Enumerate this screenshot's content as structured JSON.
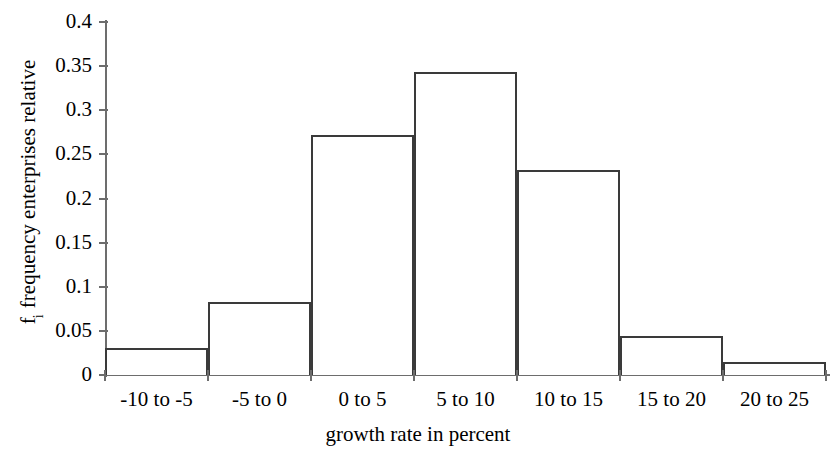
{
  "chart_data": {
    "type": "bar",
    "title": "",
    "subtitle": "",
    "xlabel": "growth rate in percent",
    "ylabel": "f_i frequency enterprises relative",
    "ylabel_main": "frequency enterprises relative",
    "ylabel_symbol": "f",
    "ylabel_subscript": "i",
    "categories": [
      "-10 to -5",
      "-5 to 0",
      "0 to 5",
      "5 to 10",
      "10 to 15",
      "15 to 20",
      "20 to 25"
    ],
    "values": [
      0.031,
      0.083,
      0.272,
      0.343,
      0.232,
      0.044,
      0.015
    ],
    "ylim": [
      0,
      0.4
    ],
    "xlim_bins": 7,
    "ytick_labels": [
      "0.4",
      "0.35",
      "0.3",
      "0.25",
      "0.2",
      "0.15",
      "0.1",
      "0.05",
      "0"
    ],
    "ytick_values": [
      0.4,
      0.35,
      0.3,
      0.25,
      0.2,
      0.15,
      0.1,
      0.05,
      0
    ],
    "grid": false,
    "legend": false,
    "legend_position": "none",
    "bar_fill_color": "#ffffff",
    "bar_edge_color": "#3a3a3a",
    "axis_color": "#6d6d6d",
    "background_color": "#ffffff",
    "text_color": "#000000"
  }
}
